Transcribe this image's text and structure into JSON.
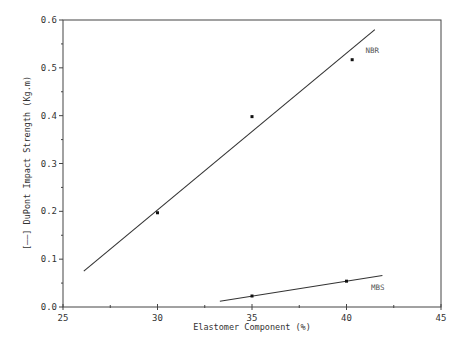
{
  "chart_data": {
    "type": "scatter",
    "title": "",
    "xlabel": "Elastomer Component (%)",
    "ylabel": "[——] DuPont Impact Strength (Kg.m)",
    "xlim": [
      25,
      45
    ],
    "ylim": [
      0.0,
      0.6
    ],
    "x_ticks": [
      25,
      30,
      35,
      40,
      45
    ],
    "x_tick_labels": [
      "25",
      "30",
      "35",
      "40",
      "45"
    ],
    "y_ticks": [
      0.0,
      0.1,
      0.2,
      0.3,
      0.4,
      0.5,
      0.6
    ],
    "y_tick_labels": [
      "0.0",
      "0.1",
      "0.2",
      "0.3",
      "0.4",
      "0.5",
      "0.6"
    ],
    "grid": false,
    "legend": "none (series labelled inline)",
    "series": [
      {
        "name": "NBR",
        "points": [
          {
            "x": 30,
            "y": 0.197
          },
          {
            "x": 35,
            "y": 0.398
          },
          {
            "x": 40.3,
            "y": 0.517
          }
        ],
        "fit_line": {
          "x0": 26.1,
          "y0": 0.075,
          "x1": 41.5,
          "y1": 0.58
        },
        "label_pos": {
          "x": 41.0,
          "y": 0.53
        }
      },
      {
        "name": "MBS",
        "points": [
          {
            "x": 35,
            "y": 0.023
          },
          {
            "x": 40,
            "y": 0.054
          }
        ],
        "fit_line": {
          "x0": 33.3,
          "y0": 0.012,
          "x1": 41.9,
          "y1": 0.066
        },
        "label_pos": {
          "x": 41.3,
          "y": 0.036
        }
      }
    ]
  }
}
